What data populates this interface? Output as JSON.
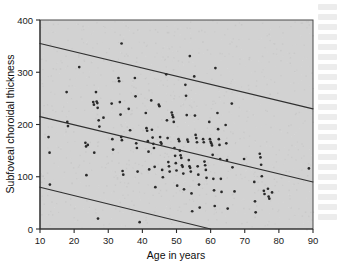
{
  "figure": {
    "background_color": "#ffffff",
    "plot_background_color": "#d2d2d2",
    "point_color": "#2a2a2a",
    "line_color": "#2f2f2f",
    "axis_color": "#2b2b2b"
  },
  "chart_data": {
    "type": "scatter",
    "title": "",
    "xlabel": "Age in years",
    "ylabel": "Subfoveal choroidal thickness",
    "xlim": [
      10,
      90
    ],
    "ylim": [
      0,
      400
    ],
    "xticks": [
      10,
      20,
      30,
      40,
      50,
      60,
      70,
      80,
      90
    ],
    "yticks": [
      0,
      100,
      200,
      300,
      400
    ],
    "xticklabels": [
      "10",
      "20",
      "30",
      "40",
      "50",
      "60",
      "70",
      "80",
      "90"
    ],
    "yticklabels": [
      "0",
      "100",
      "200",
      "300",
      "400"
    ],
    "grid": false,
    "legend": false,
    "legend_position": "none",
    "annotations": [],
    "series": [
      {
        "name": "Subjects",
        "type": "scatter",
        "marker": "circle",
        "points": [
          [
            12.5,
            176
          ],
          [
            12.8,
            146
          ],
          [
            12.9,
            85
          ],
          [
            17.8,
            262
          ],
          [
            18.0,
            205
          ],
          [
            18.2,
            197
          ],
          [
            21.5,
            310
          ],
          [
            23.3,
            165
          ],
          [
            23.5,
            158
          ],
          [
            23.6,
            103
          ],
          [
            24.0,
            161
          ],
          [
            25.6,
            243
          ],
          [
            25.8,
            238
          ],
          [
            25.9,
            146
          ],
          [
            26.4,
            262
          ],
          [
            26.6,
            244
          ],
          [
            26.8,
            241
          ],
          [
            26.9,
            232
          ],
          [
            27.2,
            208
          ],
          [
            27.4,
            196
          ],
          [
            27.0,
            20
          ],
          [
            28.6,
            213
          ],
          [
            31.0,
            240
          ],
          [
            31.2,
            172
          ],
          [
            31.4,
            152
          ],
          [
            33.0,
            289
          ],
          [
            33.2,
            283
          ],
          [
            33.4,
            243
          ],
          [
            33.6,
            219
          ],
          [
            33.8,
            176
          ],
          [
            34.0,
            170
          ],
          [
            34.2,
            111
          ],
          [
            34.4,
            104
          ],
          [
            33.9,
            355
          ],
          [
            36.0,
            230
          ],
          [
            36.4,
            189
          ],
          [
            37.8,
            289
          ],
          [
            38.0,
            254
          ],
          [
            38.2,
            164
          ],
          [
            38.4,
            155
          ],
          [
            38.6,
            110
          ],
          [
            39.2,
            13
          ],
          [
            41.0,
            222
          ],
          [
            41.2,
            193
          ],
          [
            41.4,
            188
          ],
          [
            41.6,
            168
          ],
          [
            41.8,
            148
          ],
          [
            42.0,
            114
          ],
          [
            42.6,
            246
          ],
          [
            42.8,
            190
          ],
          [
            43.0,
            175
          ],
          [
            43.2,
            163
          ],
          [
            43.4,
            155
          ],
          [
            43.6,
            119
          ],
          [
            43.8,
            80
          ],
          [
            44.8,
            238
          ],
          [
            45.0,
            235
          ],
          [
            45.2,
            176
          ],
          [
            45.4,
            166
          ],
          [
            45.6,
            163
          ],
          [
            45.8,
            113
          ],
          [
            46.0,
            99
          ],
          [
            47.0,
            296
          ],
          [
            47.2,
            208
          ],
          [
            47.4,
            174
          ],
          [
            47.6,
            128
          ],
          [
            47.8,
            120
          ],
          [
            48.0,
            110
          ],
          [
            48.6,
            223
          ],
          [
            48.8,
            218
          ],
          [
            49.0,
            214
          ],
          [
            49.2,
            205
          ],
          [
            49.4,
            155
          ],
          [
            49.6,
            140
          ],
          [
            49.8,
            126
          ],
          [
            50.0,
            112
          ],
          [
            50.2,
            83
          ],
          [
            50.6,
            172
          ],
          [
            50.8,
            168
          ],
          [
            51.0,
            150
          ],
          [
            51.2,
            141
          ],
          [
            51.4,
            136
          ],
          [
            51.6,
            122
          ],
          [
            51.8,
            119
          ],
          [
            52.0,
            106
          ],
          [
            52.2,
            76
          ],
          [
            52.6,
            276
          ],
          [
            52.8,
            255
          ],
          [
            53.0,
            218
          ],
          [
            53.2,
            171
          ],
          [
            53.4,
            167
          ],
          [
            53.6,
            132
          ],
          [
            53.8,
            120
          ],
          [
            54.0,
            117
          ],
          [
            54.2,
            110
          ],
          [
            54.4,
            68
          ],
          [
            54.6,
            34
          ],
          [
            53.9,
            331
          ],
          [
            55.2,
            292
          ],
          [
            55.4,
            217
          ],
          [
            55.6,
            180
          ],
          [
            55.8,
            174
          ],
          [
            56.0,
            166
          ],
          [
            56.2,
            120
          ],
          [
            56.4,
            104
          ],
          [
            56.6,
            85
          ],
          [
            56.8,
            41
          ],
          [
            57.8,
            172
          ],
          [
            58.0,
            166
          ],
          [
            58.2,
            129
          ],
          [
            58.4,
            122
          ],
          [
            58.6,
            113
          ],
          [
            58.8,
            98
          ],
          [
            59.6,
            205
          ],
          [
            59.8,
            172
          ],
          [
            60.0,
            167
          ],
          [
            60.2,
            164
          ],
          [
            60.4,
            160
          ],
          [
            60.6,
            142
          ],
          [
            60.8,
            96
          ],
          [
            61.0,
            74
          ],
          [
            61.2,
            44
          ],
          [
            61.4,
            308
          ],
          [
            62.0,
            222
          ],
          [
            62.2,
            191
          ],
          [
            62.4,
            172
          ],
          [
            62.6,
            161
          ],
          [
            62.8,
            134
          ],
          [
            63.0,
            96
          ],
          [
            63.2,
            71
          ],
          [
            64.4,
            199
          ],
          [
            64.6,
            164
          ],
          [
            64.8,
            132
          ],
          [
            65.0,
            39
          ],
          [
            66.2,
            240
          ],
          [
            66.4,
            118
          ],
          [
            67.0,
            72
          ],
          [
            69.8,
            134
          ],
          [
            72.8,
            90
          ],
          [
            73.0,
            53
          ],
          [
            73.2,
            32
          ],
          [
            74.4,
            144
          ],
          [
            74.6,
            137
          ],
          [
            74.8,
            123
          ],
          [
            75.0,
            101
          ],
          [
            75.6,
            73
          ],
          [
            75.8,
            67
          ],
          [
            76.8,
            77
          ],
          [
            77.0,
            62
          ],
          [
            77.2,
            58
          ],
          [
            78.0,
            70
          ],
          [
            88.8,
            116
          ]
        ]
      }
    ],
    "lines": [
      {
        "name": "upper-prediction-limit",
        "x": [
          10,
          90
        ],
        "y": [
          355,
          230
        ]
      },
      {
        "name": "regression-line",
        "x": [
          10,
          90
        ],
        "y": [
          215,
          90
        ]
      },
      {
        "name": "lower-prediction-limit",
        "x": [
          10,
          60
        ],
        "y": [
          80,
          0
        ]
      }
    ]
  }
}
